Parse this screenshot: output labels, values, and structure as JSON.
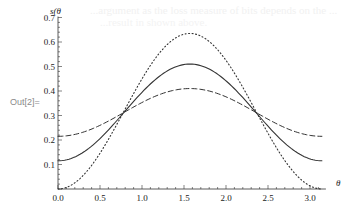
{
  "cell": {
    "out_label": "Out[2]="
  },
  "chart_data": {
    "type": "line",
    "title": "",
    "xlabel": "θ",
    "ylabel": "s(θ)",
    "xlim": [
      0,
      3.1416
    ],
    "ylim": [
      0,
      0.7
    ],
    "x_ticks": [
      "0.0",
      "0.5",
      "1.0",
      "1.5",
      "2.0",
      "2.5",
      "3.0"
    ],
    "y_ticks": [
      "0.1",
      "0.2",
      "0.3",
      "0.4",
      "0.5",
      "0.6",
      "0.7"
    ],
    "grid": false,
    "legend": null,
    "x": [
      0.0,
      0.25,
      0.5,
      0.785,
      1.0,
      1.25,
      1.5708,
      1.75,
      2.0,
      2.356,
      2.5,
      2.75,
      3.0,
      3.1416
    ],
    "series": [
      {
        "name": "solid",
        "style": "solid",
        "values": [
          0.115,
          0.139,
          0.206,
          0.313,
          0.395,
          0.466,
          0.51,
          0.497,
          0.441,
          0.313,
          0.257,
          0.17,
          0.123,
          0.115
        ]
      },
      {
        "name": "dashed",
        "style": "dashed",
        "values": [
          0.215,
          0.227,
          0.26,
          0.313,
          0.353,
          0.387,
          0.41,
          0.404,
          0.375,
          0.313,
          0.285,
          0.243,
          0.219,
          0.215
        ]
      },
      {
        "name": "dotted",
        "style": "dotted",
        "values": [
          0.0,
          0.039,
          0.146,
          0.318,
          0.45,
          0.565,
          0.635,
          0.614,
          0.524,
          0.318,
          0.227,
          0.091,
          0.013,
          0.0
        ]
      }
    ],
    "axis_labels": {
      "x": "θ",
      "y": "s(θ"
    }
  },
  "bleed_text": {
    "line1": "...argument as the loss measure of bits depends on the ...",
    "line2": "...result in shown above."
  }
}
